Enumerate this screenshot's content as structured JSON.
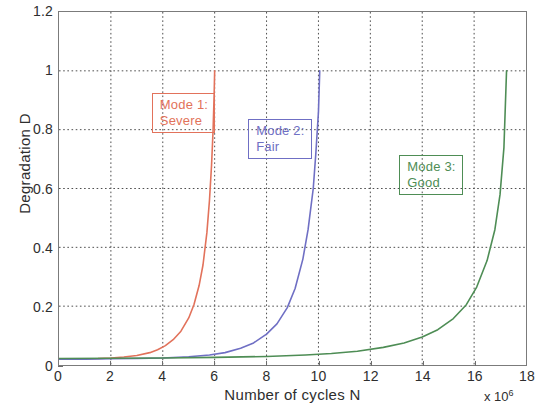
{
  "chart_data": {
    "type": "line",
    "title": "",
    "xlabel": "Number of cycles  N",
    "ylabel": "Degradation D",
    "x_multiplier": "x 10",
    "x_multiplier_exp": "6",
    "xlim": [
      0,
      18
    ],
    "ylim": [
      0,
      1.2
    ],
    "xticks": [
      0,
      2,
      4,
      6,
      8,
      10,
      12,
      14,
      16,
      18
    ],
    "xtick_labels": [
      "0",
      "2",
      "4",
      "6",
      "8",
      "10",
      "12",
      "14",
      "16",
      "18"
    ],
    "yticks": [
      0,
      0.2,
      0.4,
      0.6,
      0.8,
      1,
      1.2
    ],
    "ytick_labels": [
      "0",
      "0.2",
      "0.4",
      "0.6",
      "0.8",
      "1",
      "1.2"
    ],
    "grid": true,
    "grid_style": "dotted",
    "grid_color": "#4d4d4d",
    "legend": "none",
    "series": [
      {
        "name": "Mode 1: Severe",
        "color": "#e2725b",
        "x": [
          0.0,
          0.5,
          1.0,
          1.5,
          2.0,
          2.5,
          3.0,
          3.5,
          3.8,
          4.1,
          4.4,
          4.7,
          5.0,
          5.2,
          5.4,
          5.55,
          5.7,
          5.8,
          5.88,
          5.94,
          5.98,
          6.0
        ],
        "y": [
          0.02,
          0.02,
          0.021,
          0.022,
          0.024,
          0.027,
          0.032,
          0.042,
          0.052,
          0.066,
          0.086,
          0.115,
          0.16,
          0.205,
          0.27,
          0.34,
          0.45,
          0.56,
          0.68,
          0.8,
          0.92,
          1.0
        ]
      },
      {
        "name": "Mode 2: Fair",
        "color": "#6f6fc4",
        "x": [
          0.0,
          1.0,
          2.0,
          3.0,
          4.0,
          5.0,
          5.8,
          6.4,
          7.0,
          7.5,
          8.0,
          8.4,
          8.8,
          9.1,
          9.4,
          9.6,
          9.8,
          9.9,
          10.0,
          10.05
        ],
        "y": [
          0.02,
          0.02,
          0.021,
          0.022,
          0.024,
          0.028,
          0.034,
          0.042,
          0.057,
          0.075,
          0.105,
          0.14,
          0.195,
          0.26,
          0.36,
          0.46,
          0.6,
          0.72,
          0.86,
          1.0
        ]
      },
      {
        "name": "Mode 3: Good",
        "color": "#4e8d55",
        "x": [
          0.0,
          2.0,
          4.0,
          6.0,
          8.0,
          9.5,
          10.5,
          11.5,
          12.5,
          13.3,
          14.0,
          14.6,
          15.2,
          15.7,
          16.1,
          16.5,
          16.8,
          17.0,
          17.15,
          17.25
        ],
        "y": [
          0.022,
          0.023,
          0.024,
          0.026,
          0.029,
          0.034,
          0.039,
          0.047,
          0.06,
          0.075,
          0.095,
          0.12,
          0.158,
          0.205,
          0.265,
          0.355,
          0.46,
          0.58,
          0.74,
          1.0
        ]
      }
    ],
    "annotations": [
      {
        "id": "mode1",
        "line1": "Mode 1:",
        "line2": "Severe",
        "color": "#e2725b",
        "x_data": 3.6,
        "y_data": 0.87
      },
      {
        "id": "mode2",
        "line1": "Mode 2:",
        "line2": "Fair",
        "color": "#6f6fc4",
        "x_data": 7.3,
        "y_data": 0.78
      },
      {
        "id": "mode3",
        "line1": "Mode 3:",
        "line2": "Good",
        "color": "#4e8d55",
        "x_data": 13.1,
        "y_data": 0.66
      }
    ]
  }
}
